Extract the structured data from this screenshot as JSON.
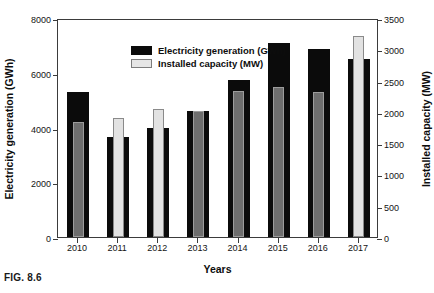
{
  "caption": "FIG. 8.6",
  "chart_data": {
    "type": "bar",
    "title": "",
    "xlabel": "Years",
    "ylabel": "Electricity generation (GWh)",
    "y2label": "Installed capacity (MW)",
    "categories": [
      "2010",
      "2011",
      "2012",
      "2013",
      "2014",
      "2015",
      "2016",
      "2017"
    ],
    "series": [
      {
        "name": "Electricity generation (GWh)",
        "axis": "left",
        "color": "#0b0b0b",
        "unit": "GWh",
        "values": [
          5300,
          3650,
          3980,
          4600,
          5740,
          7100,
          6880,
          6500
        ]
      },
      {
        "name": "Installed capacity (MW)",
        "axis": "right",
        "color": "#6e6e6e",
        "unit": "MW",
        "values": [
          1840,
          1900,
          2050,
          2010,
          2335,
          2400,
          2320,
          3220
        ]
      }
    ],
    "ylim": [
      0,
      8000
    ],
    "yticks": [
      0,
      2000,
      4000,
      6000,
      8000
    ],
    "y2lim": [
      0,
      3500
    ],
    "y2ticks": [
      0,
      500,
      1000,
      1500,
      2000,
      2500,
      3000,
      3500
    ],
    "grid": false,
    "legend_position": "top-left",
    "legend": [
      {
        "label": "Electricity generation (GWh)",
        "swatch": "black"
      },
      {
        "label": "Installed capacity (MW)",
        "swatch": "light"
      }
    ]
  }
}
